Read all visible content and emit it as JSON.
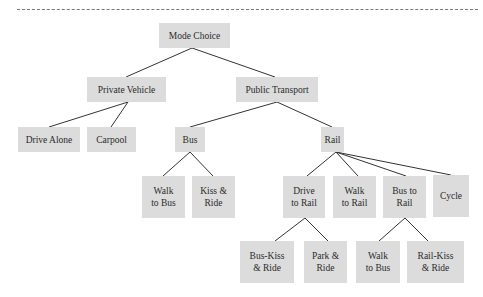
{
  "diagram": {
    "type": "tree",
    "title": "",
    "nodes": [
      {
        "id": "mode_choice",
        "label": "Mode Choice",
        "parent": null
      },
      {
        "id": "private_vehicle",
        "label": "Private Vehicle",
        "parent": "mode_choice"
      },
      {
        "id": "public_transport",
        "label": "Public Transport",
        "parent": "mode_choice"
      },
      {
        "id": "drive_alone",
        "label": "Drive Alone",
        "parent": "private_vehicle"
      },
      {
        "id": "carpool",
        "label": "Carpool",
        "parent": "private_vehicle"
      },
      {
        "id": "bus",
        "label": "Bus",
        "parent": "public_transport"
      },
      {
        "id": "rail",
        "label": "Rail",
        "parent": "public_transport"
      },
      {
        "id": "walk_to_bus",
        "label": "Walk to Bus",
        "lines": [
          "Walk",
          "to Bus"
        ],
        "parent": "bus"
      },
      {
        "id": "kiss_and_ride",
        "label": "Kiss & Ride",
        "lines": [
          "Kiss &",
          "Ride"
        ],
        "parent": "bus"
      },
      {
        "id": "drive_to_rail",
        "label": "Drive to Rail",
        "lines": [
          "Drive",
          "to Rail"
        ],
        "parent": "rail"
      },
      {
        "id": "walk_to_rail",
        "label": "Walk to Rail",
        "lines": [
          "Walk",
          "to Rail"
        ],
        "parent": "rail"
      },
      {
        "id": "bus_to_rail",
        "label": "Bus to Rail",
        "lines": [
          "Bus to",
          "Rail"
        ],
        "parent": "rail"
      },
      {
        "id": "cycle",
        "label": "Cycle",
        "parent": "rail"
      },
      {
        "id": "bus_kiss_and_ride",
        "label": "Bus-Kiss & Ride",
        "lines": [
          "Bus-Kiss",
          "& Ride"
        ],
        "parent": "drive_to_rail"
      },
      {
        "id": "park_and_ride",
        "label": "Park & Ride",
        "lines": [
          "Park &",
          "Ride"
        ],
        "parent": "drive_to_rail"
      },
      {
        "id": "walk_to_bus_2",
        "label": "Walk to Bus",
        "lines": [
          "Walk",
          "to Bus"
        ],
        "parent": "bus_to_rail"
      },
      {
        "id": "rail_kiss_and_ride",
        "label": "Rail-Kiss & Ride",
        "lines": [
          "Rail-Kiss",
          "& Ride"
        ],
        "parent": "bus_to_rail"
      }
    ]
  },
  "labels": {
    "mode_choice": "Mode Choice",
    "private_vehicle": "Private Vehicle",
    "public_transport": "Public Transport",
    "drive_alone": "Drive Alone",
    "carpool": "Carpool",
    "bus": "Bus",
    "rail": "Rail",
    "walk_to_bus": [
      "Walk",
      "to Bus"
    ],
    "kiss_and_ride": [
      "Kiss &",
      "Ride"
    ],
    "drive_to_rail": [
      "Drive",
      "to Rail"
    ],
    "walk_to_rail": [
      "Walk",
      "to Rail"
    ],
    "bus_to_rail": [
      "Bus to",
      "Rail"
    ],
    "cycle": "Cycle",
    "bus_kiss_and_ride": [
      "Bus-Kiss",
      "& Ride"
    ],
    "park_and_ride": [
      "Park &",
      "Ride"
    ],
    "walk_to_bus_2": [
      "Walk",
      "to Bus"
    ],
    "rail_kiss_and_ride": [
      "Rail-Kiss",
      "& Ride"
    ]
  },
  "colors": {
    "node_fill": "#dcdcdc",
    "text": "#2b2b2b",
    "edge": "#333333",
    "divider": "#777777"
  }
}
